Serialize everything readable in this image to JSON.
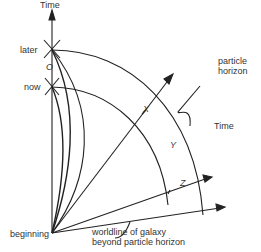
{
  "labels": {
    "time_vertical": "Time",
    "later": "later",
    "now": "now",
    "observer": "O",
    "beginning": "beginning",
    "particle_horizon_line1": "particle",
    "particle_horizon_line2": "horizon",
    "time_diagonal": "Time",
    "galaxy_x": "X",
    "galaxy_y": "Y",
    "galaxy_z": "Z",
    "worldline_line1": "worldline of galaxy",
    "worldline_line2": "beyond particle horizon"
  },
  "colors": {
    "ink": "#222222",
    "background": "#ffffff"
  }
}
